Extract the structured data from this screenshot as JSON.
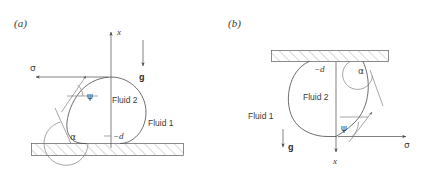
{
  "figure": {
    "type": "diagram",
    "panels": [
      {
        "id": "a",
        "label": "(a)",
        "orientation": "sessile-droplet-on-substrate",
        "labels": {
          "fluid_inner": "Fluid 2",
          "fluid_outer": "Fluid 1",
          "axis_x": "x",
          "gravity": "g",
          "surface_tension": "σ",
          "tangent_angle": "ψ",
          "contact_angle": "α",
          "depth": "−d"
        },
        "directions": {
          "axis_x": "up",
          "gravity": "down",
          "surface_tension": "left",
          "substrate": "bottom"
        }
      },
      {
        "id": "b",
        "label": "(b)",
        "orientation": "pendant-droplet-under-ceiling",
        "labels": {
          "fluid_inner": "Fluid 2",
          "fluid_outer": "Fluid 1",
          "axis_x": "x",
          "gravity": "g",
          "surface_tension": "σ",
          "tangent_angle": "ψ",
          "contact_angle": "α",
          "depth": "−d"
        },
        "directions": {
          "axis_x": "down",
          "gravity": "down",
          "surface_tension": "right",
          "substrate": "top"
        }
      }
    ],
    "colors": {
      "line": "#4a4a4a",
      "text": "#3a3a3a",
      "hatch": "#7a7a7a",
      "background": "#ffffff"
    }
  }
}
